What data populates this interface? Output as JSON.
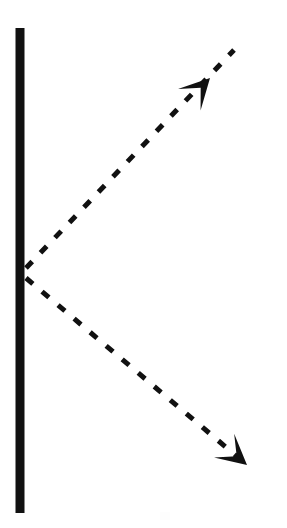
{
  "figure": {
    "kind": "optics-ray-diagram",
    "width": 287,
    "height": 528,
    "background_color": "#ffffff",
    "ink_color": "#111111"
  },
  "mirror": {
    "name": "plane-mirror-surface",
    "orientation": "vertical",
    "x": 20,
    "y_top": 28,
    "y_bottom": 513,
    "thickness": 9,
    "color": "#111111"
  },
  "vertex": {
    "name": "point-of-incidence",
    "x": 26,
    "y": 272
  },
  "rays": [
    {
      "id": "incident-ray",
      "label": "incident ray",
      "style": "dashed",
      "stroke_width": 5,
      "dash_array": "9 12",
      "color": "#111111",
      "from_x": 26,
      "from_y": 268,
      "to_x": 234,
      "to_y": 50,
      "direction": "up-right",
      "angle_degrees": 46,
      "arrow": {
        "name": "arrowhead-upper",
        "position": "mid-ray",
        "tip_x": 210,
        "tip_y": 78,
        "size": 30,
        "shape": "concave-barbed-dart",
        "points_toward": "up-right"
      }
    },
    {
      "id": "reflected-ray",
      "label": "reflected ray",
      "style": "dashed",
      "stroke_width": 5,
      "dash_array": "9 12",
      "color": "#111111",
      "from_x": 26,
      "from_y": 278,
      "to_x": 247,
      "to_y": 465,
      "direction": "down-right",
      "angle_degrees": 40,
      "arrow": {
        "name": "arrowhead-lower",
        "position": "end-of-ray",
        "tip_x": 247,
        "tip_y": 465,
        "size": 30,
        "shape": "concave-barbed-dart",
        "points_toward": "down-right"
      }
    }
  ],
  "artifacts": [
    {
      "name": "scan-smudge",
      "x": 160,
      "y": 512,
      "width": 10,
      "height": 8,
      "color": "#d8d8d8"
    }
  ]
}
